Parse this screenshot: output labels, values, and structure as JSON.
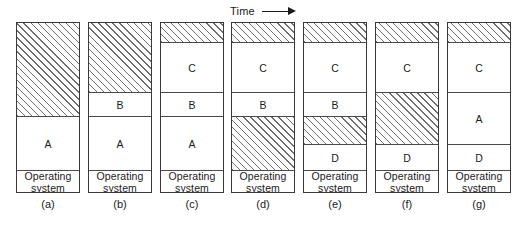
{
  "figure": {
    "title_axis": {
      "label": "Time",
      "arrow_icon": "arrow-right-icon"
    },
    "legend_note": {
      "free_fill": "hatched",
      "used_fill": "white"
    },
    "colors": {
      "border": "#3a3a3a",
      "segment_divider": "#4a4a4a",
      "hatch_line": "#6e6e6e",
      "background": "#ffffff",
      "text": "#1a1a1a"
    },
    "os_label": "Operating\nsystem",
    "columns": [
      {
        "caption": "(a)",
        "x": 16,
        "segments": [
          {
            "label": "",
            "kind": "free",
            "height": 94
          },
          {
            "label": "A",
            "kind": "used",
            "height": 54
          },
          {
            "label": "Operating\nsystem",
            "kind": "os",
            "height": 23
          }
        ]
      },
      {
        "caption": "(b)",
        "x": 88,
        "segments": [
          {
            "label": "",
            "kind": "free",
            "height": 70
          },
          {
            "label": "B",
            "kind": "used",
            "height": 24
          },
          {
            "label": "A",
            "kind": "used",
            "height": 54
          },
          {
            "label": "Operating\nsystem",
            "kind": "os",
            "height": 23
          }
        ]
      },
      {
        "caption": "(c)",
        "x": 160,
        "segments": [
          {
            "label": "",
            "kind": "free",
            "height": 20
          },
          {
            "label": "C",
            "kind": "used",
            "height": 50
          },
          {
            "label": "B",
            "kind": "used",
            "height": 24
          },
          {
            "label": "A",
            "kind": "used",
            "height": 54
          },
          {
            "label": "Operating\nsystem",
            "kind": "os",
            "height": 23
          }
        ]
      },
      {
        "caption": "(d)",
        "x": 231,
        "segments": [
          {
            "label": "",
            "kind": "free",
            "height": 20
          },
          {
            "label": "C",
            "kind": "used",
            "height": 50
          },
          {
            "label": "B",
            "kind": "used",
            "height": 24
          },
          {
            "label": "",
            "kind": "free",
            "height": 54
          },
          {
            "label": "Operating\nsystem",
            "kind": "os",
            "height": 23
          }
        ]
      },
      {
        "caption": "(e)",
        "x": 303,
        "segments": [
          {
            "label": "",
            "kind": "free",
            "height": 20
          },
          {
            "label": "C",
            "kind": "used",
            "height": 50
          },
          {
            "label": "B",
            "kind": "used",
            "height": 24
          },
          {
            "label": "",
            "kind": "free",
            "height": 28
          },
          {
            "label": "D",
            "kind": "used",
            "height": 26
          },
          {
            "label": "Operating\nsystem",
            "kind": "os",
            "height": 23
          }
        ]
      },
      {
        "caption": "(f)",
        "x": 375,
        "segments": [
          {
            "label": "",
            "kind": "free",
            "height": 20
          },
          {
            "label": "C",
            "kind": "used",
            "height": 50
          },
          {
            "label": "",
            "kind": "free",
            "height": 52
          },
          {
            "label": "D",
            "kind": "used",
            "height": 26
          },
          {
            "label": "Operating\nsystem",
            "kind": "os",
            "height": 23
          }
        ]
      },
      {
        "caption": "(g)",
        "x": 447,
        "segments": [
          {
            "label": "",
            "kind": "free",
            "height": 20
          },
          {
            "label": "C",
            "kind": "used",
            "height": 50
          },
          {
            "label": "A",
            "kind": "used",
            "height": 52
          },
          {
            "label": "D",
            "kind": "used",
            "height": 26
          },
          {
            "label": "Operating\nsystem",
            "kind": "os",
            "height": 23
          }
        ]
      }
    ]
  }
}
